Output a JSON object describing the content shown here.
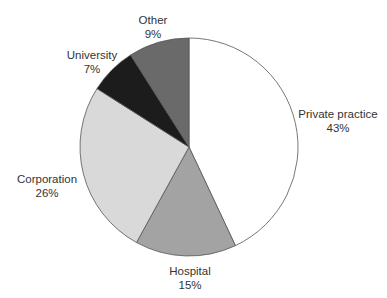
{
  "chart_data": {
    "type": "pie",
    "title": "",
    "categories": [
      "Private practice",
      "Hospital",
      "Corporation",
      "University",
      "Other"
    ],
    "values": [
      43,
      15,
      26,
      7,
      9
    ],
    "unit": "%",
    "colors": [
      "#ffffff",
      "#a3a3a3",
      "#d9d9d9",
      "#1c1c1c",
      "#6a6a6a"
    ],
    "start_angle": "12 o'clock",
    "direction": "clockwise"
  },
  "labels": {
    "private": {
      "name": "Private practice",
      "pct": "43%"
    },
    "hospital": {
      "name": "Hospital",
      "pct": "15%"
    },
    "corporation": {
      "name": "Corporation",
      "pct": "26%"
    },
    "university": {
      "name": "University",
      "pct": "7%"
    },
    "other": {
      "name": "Other",
      "pct": "9%"
    }
  }
}
